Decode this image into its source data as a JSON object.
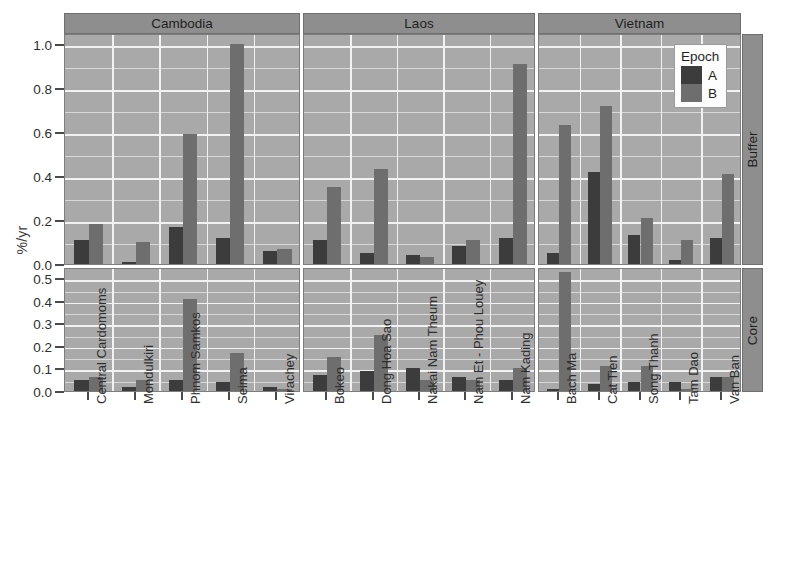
{
  "figure": {
    "ylabel": "%/yr",
    "legend": {
      "title": "Epoch",
      "entries": [
        {
          "label": "A",
          "color": "#3c3c3c"
        },
        {
          "label": "B",
          "color": "#6e6e6e"
        }
      ]
    },
    "column_strips": [
      "Cambodia",
      "Laos",
      "Vietnam"
    ],
    "row_strips": [
      "Buffer",
      "Core"
    ]
  },
  "chart_data": {
    "type": "bar",
    "title": "",
    "xlabel": "",
    "ylabel": "%/yr",
    "grid": true,
    "legend_position": "top-right-inside",
    "legend_title": "Epoch",
    "facet_columns": [
      "Cambodia",
      "Laos",
      "Vietnam"
    ],
    "facet_rows": [
      "Buffer",
      "Core"
    ],
    "series": [
      {
        "name": "A",
        "color": "#3c3c3c"
      },
      {
        "name": "B",
        "color": "#6e6e6e"
      }
    ],
    "panels": [
      {
        "row": "Buffer",
        "column": "Cambodia",
        "ylim": [
          0.0,
          1.05
        ],
        "yticks": [
          0.0,
          0.2,
          0.4,
          0.6,
          0.8,
          1.0
        ],
        "ytick_labels": [
          "0.0",
          "0.2",
          "0.4",
          "0.6",
          "0.8",
          "1.0"
        ],
        "categories": [
          "Central Cardomoms",
          "Mondulkiri",
          "Phnom Samkos",
          "Seima",
          "Virachey"
        ],
        "values_A": [
          0.11,
          0.01,
          0.17,
          0.12,
          0.06
        ],
        "values_B": [
          0.18,
          0.1,
          0.59,
          1.0,
          0.07
        ]
      },
      {
        "row": "Buffer",
        "column": "Laos",
        "ylim": [
          0.0,
          1.05
        ],
        "yticks": [
          0.0,
          0.2,
          0.4,
          0.6,
          0.8,
          1.0
        ],
        "ytick_labels": [
          "0.0",
          "0.2",
          "0.4",
          "0.6",
          "0.8",
          "1.0"
        ],
        "categories": [
          "Bokeo",
          "Dong Hoa Sao",
          "Nakai Nam Theum",
          "Nam Et - Phou Louey",
          "Nam Kading"
        ],
        "values_A": [
          0.11,
          0.05,
          0.04,
          0.08,
          0.12
        ],
        "values_B": [
          0.35,
          0.43,
          0.03,
          0.11,
          0.91
        ]
      },
      {
        "row": "Buffer",
        "column": "Vietnam",
        "ylim": [
          0.0,
          1.05
        ],
        "yticks": [
          0.0,
          0.2,
          0.4,
          0.6,
          0.8,
          1.0
        ],
        "ytick_labels": [
          "0.0",
          "0.2",
          "0.4",
          "0.6",
          "0.8",
          "1.0"
        ],
        "categories": [
          "Bach Ma",
          "Cat Tien",
          "Song Thanh",
          "Tam Dao",
          "Van Ban"
        ],
        "values_A": [
          0.05,
          0.42,
          0.13,
          0.02,
          0.12
        ],
        "values_B": [
          0.63,
          0.72,
          0.21,
          0.11,
          0.41
        ]
      },
      {
        "row": "Core",
        "column": "Cambodia",
        "ylim": [
          0.0,
          0.55
        ],
        "yticks": [
          0.0,
          0.1,
          0.2,
          0.3,
          0.4,
          0.5
        ],
        "ytick_labels": [
          "0.0",
          "0.1",
          "0.2",
          "0.3",
          "0.4",
          "0.5"
        ],
        "categories": [
          "Central Cardomoms",
          "Mondulkiri",
          "Phnom Samkos",
          "Seima",
          "Virachey"
        ],
        "values_A": [
          0.05,
          0.02,
          0.05,
          0.04,
          0.02
        ],
        "values_B": [
          0.06,
          0.05,
          0.41,
          0.17,
          0.01
        ]
      },
      {
        "row": "Core",
        "column": "Laos",
        "ylim": [
          0.0,
          0.55
        ],
        "yticks": [
          0.0,
          0.1,
          0.2,
          0.3,
          0.4,
          0.5
        ],
        "ytick_labels": [
          "0.0",
          "0.1",
          "0.2",
          "0.3",
          "0.4",
          "0.5"
        ],
        "categories": [
          "Bokeo",
          "Dong Hoa Sao",
          "Nakai Nam Theum",
          "Nam Et - Phou Louey",
          "Nam Kading"
        ],
        "values_A": [
          0.07,
          0.09,
          0.1,
          0.06,
          0.05
        ],
        "values_B": [
          0.15,
          0.25,
          0.05,
          0.05,
          0.1
        ]
      },
      {
        "row": "Core",
        "column": "Vietnam",
        "ylim": [
          0.0,
          0.55
        ],
        "yticks": [
          0.0,
          0.1,
          0.2,
          0.3,
          0.4,
          0.5
        ],
        "ytick_labels": [
          "0.0",
          "0.1",
          "0.2",
          "0.3",
          "0.4",
          "0.5"
        ],
        "categories": [
          "Bach Ma",
          "Cat Tien",
          "Song Thanh",
          "Tam Dao",
          "Van Ban"
        ],
        "values_A": [
          0.01,
          0.03,
          0.04,
          0.04,
          0.06
        ],
        "values_B": [
          0.53,
          0.11,
          0.11,
          0.01,
          0.06
        ]
      }
    ]
  }
}
